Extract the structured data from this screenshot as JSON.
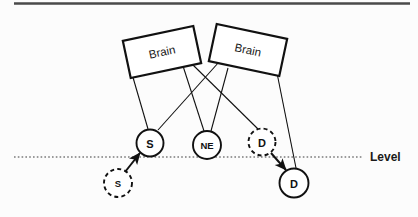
{
  "figure": {
    "background_color": "#fcfcfc",
    "stroke_color": "#111111",
    "top_rule_color": "#4a4a4a",
    "level_line_color": "#3a3a3a"
  },
  "boxes": [
    {
      "id": "brain-left",
      "label": "Brain",
      "cx": 162,
      "cy": 52,
      "w": 72,
      "h": 38,
      "rotation": -12
    },
    {
      "id": "brain-right",
      "label": "Brain",
      "cx": 248,
      "cy": 50,
      "w": 72,
      "h": 38,
      "rotation": 12
    }
  ],
  "nodes": [
    {
      "id": "s-solid",
      "label": "S",
      "cx": 150,
      "cy": 143,
      "r": 13.5,
      "style": "solid",
      "position": "above-level"
    },
    {
      "id": "ne-solid",
      "label": "NE",
      "cx": 207,
      "cy": 145,
      "r": 14.0,
      "style": "solid",
      "position": "on-level"
    },
    {
      "id": "d-dashed",
      "label": "D",
      "cx": 262,
      "cy": 142,
      "r": 13.5,
      "style": "dashed",
      "position": "above-level"
    },
    {
      "id": "s-dashed",
      "label": "S",
      "cx": 118,
      "cy": 183,
      "r": 14.0,
      "style": "dashed",
      "position": "below-level"
    },
    {
      "id": "d-solid",
      "label": "D",
      "cx": 294,
      "cy": 183,
      "r": 14.5,
      "style": "solid",
      "position": "below-level"
    }
  ],
  "connectors": [
    {
      "from": "brain-left",
      "to": "s-solid",
      "kind": "plain"
    },
    {
      "from": "brain-left",
      "to": "ne-solid",
      "kind": "plain"
    },
    {
      "from": "brain-left",
      "to": "d-dashed",
      "kind": "plain"
    },
    {
      "from": "brain-right",
      "to": "s-solid",
      "kind": "plain"
    },
    {
      "from": "brain-right",
      "to": "ne-solid",
      "kind": "plain"
    },
    {
      "from": "brain-right",
      "to": "d-solid",
      "kind": "plain"
    }
  ],
  "arrows": [
    {
      "id": "arrow-s-up",
      "from": "s-dashed",
      "to": "s-solid",
      "kind": "arrow"
    },
    {
      "id": "arrow-d-down",
      "from": "d-dashed",
      "to": "d-solid",
      "kind": "arrow"
    }
  ],
  "level_line": {
    "label": "Level",
    "y": 157,
    "x_start": 14,
    "x_end": 362,
    "label_x": 370,
    "style": "dotted"
  }
}
